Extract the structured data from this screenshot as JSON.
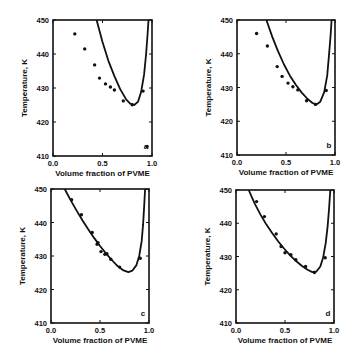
{
  "figure": {
    "xlabel": "Volume fraction of PVME",
    "ylabel": "Temperature, K",
    "xticks": [
      "0.0",
      "0.5",
      "1.0"
    ],
    "yticks": [
      "410",
      "420",
      "430",
      "440",
      "450"
    ],
    "ink_color": "#111111"
  },
  "chart_data": [
    {
      "type": "scatter",
      "panel_label": "a",
      "title": "",
      "xlabel": "Volume fraction of PVME",
      "ylabel": "Temperature, K",
      "xlim": [
        0.0,
        1.0
      ],
      "ylim": [
        410,
        450
      ],
      "xticks": [
        0.0,
        0.5,
        1.0
      ],
      "yticks": [
        410,
        420,
        430,
        440,
        450
      ],
      "grid": false,
      "series": [
        {
          "name": "experimental",
          "kind": "points",
          "x": [
            0.22,
            0.32,
            0.42,
            0.47,
            0.53,
            0.58,
            0.62,
            0.71,
            0.8,
            0.91,
            0.95
          ],
          "y": [
            445.9,
            441.5,
            436.8,
            432.9,
            431.2,
            430.3,
            429.4,
            426.2,
            425.1,
            429.1,
            412.8
          ]
        },
        {
          "name": "calculated spinodal",
          "kind": "line",
          "x": [
            0.44,
            0.5,
            0.56,
            0.62,
            0.68,
            0.74,
            0.78,
            0.82,
            0.86,
            0.89,
            0.92,
            0.94,
            0.955,
            0.965
          ],
          "y": [
            450,
            443.5,
            438.0,
            433.5,
            429.6,
            426.6,
            425.4,
            425.0,
            426.0,
            428.8,
            434.0,
            440.0,
            445.5,
            450
          ]
        }
      ]
    },
    {
      "type": "scatter",
      "panel_label": "b",
      "title": "",
      "xlabel": "Volume fraction of PVME",
      "ylabel": "Temperature, K",
      "xlim": [
        0.0,
        1.0
      ],
      "ylim": [
        410,
        450
      ],
      "xticks": [
        0.0,
        0.5,
        1.0
      ],
      "yticks": [
        410,
        420,
        430,
        440,
        450
      ],
      "grid": false,
      "series": [
        {
          "name": "experimental",
          "kind": "points",
          "x": [
            0.2,
            0.31,
            0.41,
            0.46,
            0.52,
            0.57,
            0.62,
            0.71,
            0.8,
            0.91
          ],
          "y": [
            446.0,
            442.3,
            436.2,
            433.3,
            431.3,
            430.2,
            429.3,
            426.1,
            425.0,
            429.1
          ]
        },
        {
          "name": "calculated spinodal",
          "kind": "line",
          "x": [
            0.3,
            0.36,
            0.42,
            0.48,
            0.54,
            0.6,
            0.66,
            0.72,
            0.77,
            0.81,
            0.85,
            0.89,
            0.92,
            0.94,
            0.955,
            0.965
          ],
          "y": [
            450,
            445.0,
            440.6,
            436.8,
            433.5,
            430.8,
            428.5,
            426.6,
            425.4,
            425.0,
            425.8,
            428.6,
            433.5,
            440.0,
            445.5,
            450
          ]
        }
      ]
    },
    {
      "type": "scatter",
      "panel_label": "c",
      "title": "",
      "xlabel": "Volume fraction of PVME",
      "ylabel": "Temperature, K",
      "xlim": [
        0.0,
        1.0
      ],
      "ylim": [
        410,
        450
      ],
      "xticks": [
        0.0,
        0.5,
        1.0
      ],
      "yticks": [
        410,
        420,
        430,
        440,
        450
      ],
      "grid": false,
      "series": [
        {
          "name": "experimental",
          "kind": "points",
          "x": [
            0.21,
            0.31,
            0.42,
            0.47,
            0.48,
            0.51,
            0.55,
            0.57,
            0.61,
            0.7,
            0.91
          ],
          "y": [
            446.8,
            442.3,
            437.0,
            433.5,
            434.0,
            431.3,
            430.5,
            430.7,
            429.0,
            426.7,
            429.3
          ]
        },
        {
          "name": "calculated spinodal",
          "kind": "line",
          "x": [
            0.14,
            0.2,
            0.26,
            0.32,
            0.38,
            0.44,
            0.5,
            0.56,
            0.62,
            0.68,
            0.74,
            0.79,
            0.83,
            0.87,
            0.9,
            0.925,
            0.94,
            0.95,
            0.96
          ],
          "y": [
            450,
            446.7,
            443.6,
            440.7,
            438.0,
            435.4,
            433.0,
            430.8,
            428.8,
            427.0,
            425.7,
            425.2,
            425.6,
            427.2,
            430.0,
            434.5,
            439.5,
            444.5,
            450
          ]
        }
      ]
    },
    {
      "type": "scatter",
      "panel_label": "d",
      "title": "",
      "xlabel": "Volume fraction of PVME",
      "ylabel": "Temperature, K",
      "xlim": [
        0.0,
        1.0
      ],
      "ylim": [
        410,
        450
      ],
      "xticks": [
        0.0,
        0.5,
        1.0
      ],
      "yticks": [
        410,
        420,
        430,
        440,
        450
      ],
      "grid": false,
      "series": [
        {
          "name": "experimental",
          "kind": "points",
          "x": [
            0.21,
            0.29,
            0.41,
            0.46,
            0.5,
            0.56,
            0.61,
            0.71,
            0.8,
            0.91
          ],
          "y": [
            446.5,
            442.0,
            436.8,
            433.0,
            431.1,
            430.5,
            429.0,
            427.0,
            425.2,
            429.6
          ]
        },
        {
          "name": "calculated spinodal",
          "kind": "line",
          "x": [
            0.13,
            0.19,
            0.25,
            0.31,
            0.37,
            0.43,
            0.49,
            0.55,
            0.61,
            0.67,
            0.73,
            0.78,
            0.82,
            0.86,
            0.89,
            0.915,
            0.935,
            0.95,
            0.962
          ],
          "y": [
            450,
            446.0,
            442.6,
            439.6,
            437.0,
            434.6,
            432.4,
            430.4,
            428.7,
            427.2,
            426.0,
            425.3,
            425.5,
            427.0,
            429.8,
            434.0,
            439.0,
            444.5,
            450
          ]
        }
      ]
    }
  ]
}
